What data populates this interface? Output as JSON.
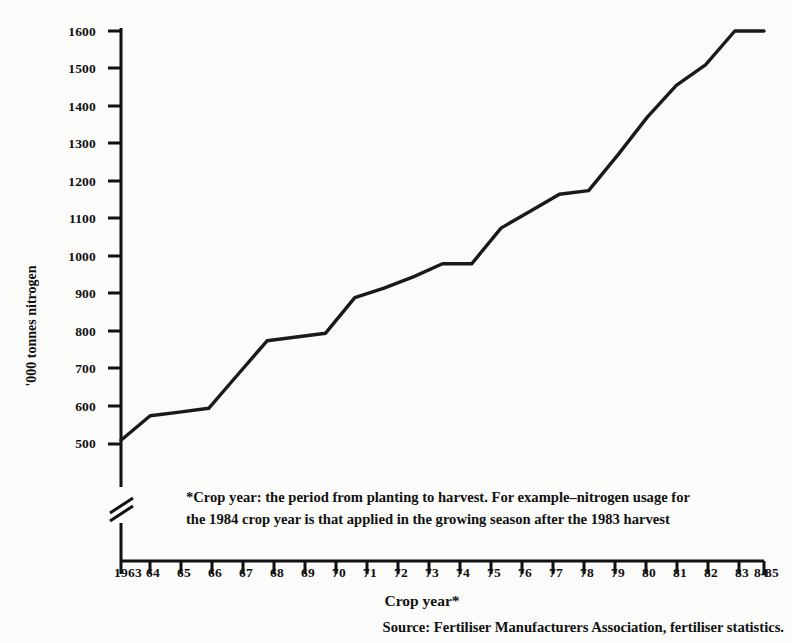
{
  "chart_data": {
    "type": "line",
    "title": "",
    "xlabel": "Crop year*",
    "ylabel": "'000 tonnes nitrogen",
    "categories": [
      "1963",
      "64",
      "65",
      "66",
      "67",
      "68",
      "69",
      "70",
      "71",
      "72",
      "73",
      "74",
      "75",
      "76",
      "77",
      "78",
      "79",
      "80",
      "81",
      "82",
      "83",
      "84",
      "85"
    ],
    "x": [
      1963,
      1964,
      1965,
      1966,
      1967,
      1968,
      1969,
      1970,
      1971,
      1972,
      1973,
      1974,
      1975,
      1976,
      1977,
      1978,
      1979,
      1980,
      1981,
      1982,
      1983,
      1984,
      1985
    ],
    "values": [
      510,
      575,
      585,
      595,
      685,
      775,
      785,
      795,
      890,
      915,
      945,
      980,
      980,
      1075,
      1120,
      1165,
      1175,
      1270,
      1370,
      1455,
      1510,
      1600,
      1600
    ],
    "series": [
      {
        "name": "nitrogen usage",
        "values": [
          510,
          575,
          585,
          595,
          685,
          775,
          785,
          795,
          890,
          915,
          945,
          980,
          980,
          1075,
          1120,
          1165,
          1175,
          1270,
          1370,
          1455,
          1510,
          1600,
          1600
        ]
      }
    ],
    "yticks": [
      500,
      600,
      700,
      800,
      900,
      1000,
      1100,
      1200,
      1300,
      1400,
      1500,
      1600
    ],
    "ylim": [
      500,
      1600
    ],
    "xlim": [
      1963,
      1985
    ],
    "grid": false,
    "legend": null,
    "axis_break": true,
    "line_color": "#1a1a1a"
  },
  "axis": {
    "y_label": "'000 tonnes nitrogen",
    "x_label": "Crop year*",
    "y_tick_labels": [
      "1600",
      "1500",
      "1400",
      "1300",
      "1200",
      "1100",
      "1000",
      "900",
      "800",
      "700",
      "600",
      "500"
    ],
    "x_tick_labels": [
      "1963",
      "64",
      "65",
      "66",
      "67",
      "68",
      "69",
      "70",
      "71",
      "72",
      "73",
      "74",
      "75",
      "76",
      "77",
      "78",
      "79",
      "80",
      "81",
      "82",
      "83",
      "84",
      "85"
    ]
  },
  "footnote": {
    "line1": "*Crop year: the period from planting to harvest. For example–nitrogen usage for",
    "line2": "the 1984 crop year is that applied in the growing season after the 1983 harvest"
  },
  "source": {
    "text": "Source: Fertiliser Manufacturers Association, fertiliser statistics."
  },
  "colors": {
    "ink": "#111111",
    "paper": "#fbfbfa",
    "line": "#1a1a1a"
  }
}
